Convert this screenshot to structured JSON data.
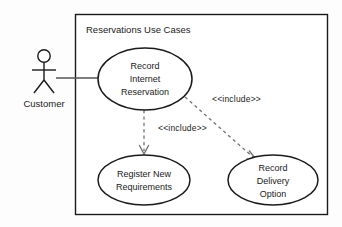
{
  "diagram": {
    "kind": "uml-use-case-diagram",
    "background_color": "#fdfdfd",
    "stroke_color": "#1a1a1a",
    "fill_color": "#ffffff",
    "system_boundary": {
      "title": "Reservations Use Cases",
      "x": 75,
      "y": 14,
      "width": 253,
      "height": 201
    },
    "actors": [
      {
        "id": "customer",
        "label": "Customer",
        "x": 44,
        "y": 56
      }
    ],
    "use_cases": [
      {
        "id": "record-internet-reservation",
        "lines": [
          "Record",
          "Internet",
          "Reservation"
        ],
        "cx": 145,
        "cy": 79,
        "rx": 47,
        "ry": 31
      },
      {
        "id": "register-new-requirements",
        "lines": [
          "Register New",
          "Requirements"
        ],
        "cx": 144,
        "cy": 180,
        "rx": 46,
        "ry": 25
      },
      {
        "id": "record-delivery-option",
        "lines": [
          "Record",
          "Delivery",
          "Option"
        ],
        "cx": 273,
        "cy": 180,
        "rx": 45,
        "ry": 25
      }
    ],
    "associations": [
      {
        "id": "customer-to-record-internet-reservation",
        "from": "customer",
        "to": "record-internet-reservation",
        "style": "solid"
      }
    ],
    "dependencies": [
      {
        "id": "include-register-new-requirements",
        "from": "record-internet-reservation",
        "to": "register-new-requirements",
        "stereotype": "<<include>>",
        "style": "dashed",
        "label_x": 158,
        "label_y": 128
      },
      {
        "id": "include-record-delivery-option",
        "from": "record-internet-reservation",
        "to": "record-delivery-option",
        "stereotype": "<<include>>",
        "style": "dashed",
        "label_x": 212,
        "label_y": 99
      }
    ]
  }
}
